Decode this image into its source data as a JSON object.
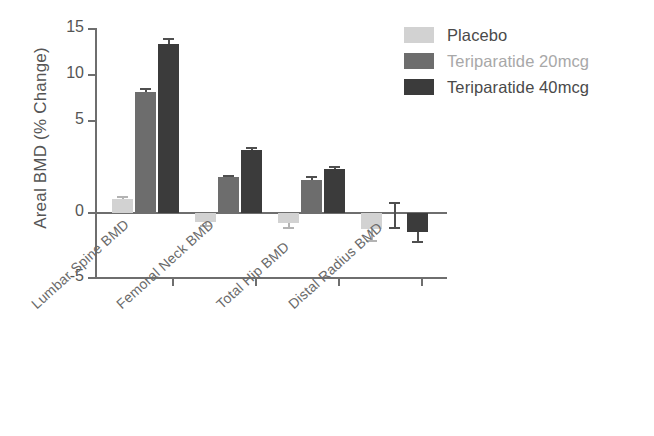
{
  "chart_data": {
    "type": "bar",
    "title": "",
    "subtitle": "",
    "xlabel": "",
    "ylabel": "Areal BMD (% Change)",
    "categories": [
      "Lumbar Spine BMD",
      "Femoral Neck BMD",
      "Total Hip BMD",
      "Distal Radius BMD"
    ],
    "series": [
      {
        "name": "Placebo",
        "color": "#d2d2d2",
        "values": [
          1.1,
          -0.7,
          -0.8,
          -1.3
        ],
        "errors": [
          0.25,
          0.3,
          0.3,
          0.9
        ]
      },
      {
        "name": "Teriparatide 20mcg",
        "color": "#6d6d6d",
        "values": [
          9.8,
          2.9,
          2.7,
          -0.1
        ],
        "errors": [
          0.3,
          0.2,
          0.3,
          1.0
        ]
      },
      {
        "name": "Teriparatide 40mcg",
        "color": "#3b3b3b",
        "values": [
          13.7,
          5.1,
          3.6,
          -1.5
        ],
        "errors": [
          0.45,
          0.25,
          0.25,
          0.8
        ]
      }
    ],
    "ylim": [
      -5,
      15
    ],
    "yticks": [
      15,
      10,
      5,
      0,
      -5
    ],
    "ytick_labels": [
      "15",
      "10",
      "5",
      "0",
      "-5"
    ],
    "grid": false,
    "legend_position": "top-right",
    "axis_color": "#6e6e6e"
  },
  "legend": {
    "entries": [
      {
        "label": "Placebo",
        "swatch": "#d2d2d2",
        "text_color": "#4a4a4a"
      },
      {
        "label": "Teriparatide 20mcg",
        "swatch": "#6d6d6d",
        "text_color": "#a8a8a8"
      },
      {
        "label": "Teriparatide 40mcg",
        "swatch": "#3b3b3b",
        "text_color": "#4a4a4a"
      }
    ]
  },
  "axis": {
    "y_title": "Areal BMD (% Change)",
    "y_tick_0": "15",
    "y_tick_1": "10",
    "y_tick_2": "5",
    "y_tick_3": "0",
    "y_tick_4": "-5",
    "x_label_0": "Lumbar Spine BMD",
    "x_label_1": "Femoral Neck BMD",
    "x_label_2": "Total Hip BMD",
    "x_label_3": "Distal Radius BMD"
  }
}
